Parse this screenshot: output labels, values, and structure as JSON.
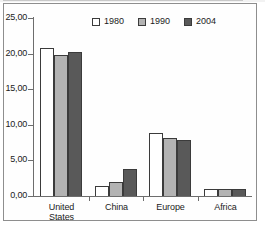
{
  "chart_data": {
    "type": "bar",
    "title": "",
    "xlabel": "",
    "ylabel": "",
    "categories": [
      "United States",
      "China",
      "Europe",
      "Africa"
    ],
    "category_lines": [
      [
        "United",
        "States"
      ],
      [
        "China"
      ],
      [
        "Europe"
      ],
      [
        "Africa"
      ]
    ],
    "series": [
      {
        "name": "1980",
        "color": "#ffffff",
        "values": [
          20.8,
          1.4,
          8.9,
          1.0
        ]
      },
      {
        "name": "1990",
        "color": "#b3b3b3",
        "values": [
          19.8,
          2.0,
          8.1,
          1.0
        ]
      },
      {
        "name": "2004",
        "color": "#595959",
        "values": [
          20.2,
          3.8,
          7.8,
          1.0
        ]
      }
    ],
    "ylim": [
      0,
      25
    ],
    "yticks": [
      0,
      5,
      10,
      15,
      20,
      25
    ],
    "ytick_labels": [
      "0,00",
      "5,00",
      "10,00",
      "15,00",
      "20,00",
      "25,00"
    ],
    "grid": false,
    "legend_position": "top-center",
    "legend_entries": [
      "1980",
      "1990",
      "2004"
    ]
  },
  "colors": {
    "series_1980": "#ffffff",
    "series_1990": "#b3b3b3",
    "series_2004": "#595959",
    "axis": "#6d6d6d",
    "bar_outline": "#3b3b3b",
    "frame": "#8e8e8e",
    "text": "#1b1b1b"
  }
}
